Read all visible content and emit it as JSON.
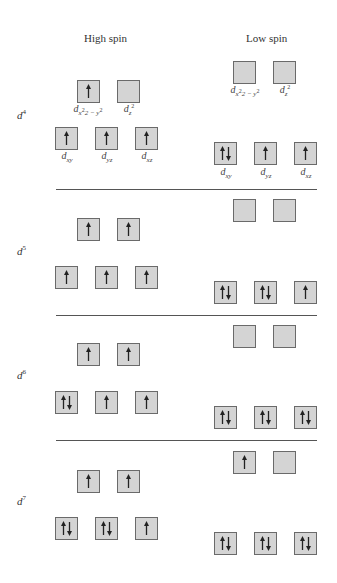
{
  "headers": {
    "high_spin": "High spin",
    "low_spin": "Low spin"
  },
  "orbital_labels": {
    "dx2y2": {
      "base": "d",
      "sub": "x",
      "rest": "2 − y",
      "sup": "2"
    },
    "dz2": {
      "base": "d",
      "sub": "z",
      "sup": "2"
    },
    "dxy": {
      "base": "d",
      "sub": "xy"
    },
    "dyz": {
      "base": "d",
      "sub": "yz"
    },
    "dxz": {
      "base": "d",
      "sub": "xz"
    }
  },
  "configs": [
    {
      "label_base": "d",
      "label_sup": "4",
      "high": {
        "eg": [
          "up",
          "empty"
        ],
        "t2g": [
          "up",
          "up",
          "up"
        ]
      },
      "low": {
        "eg": [
          "empty",
          "empty"
        ],
        "t2g": [
          "pair",
          "up",
          "up"
        ]
      }
    },
    {
      "label_base": "d",
      "label_sup": "5",
      "high": {
        "eg": [
          "up",
          "up"
        ],
        "t2g": [
          "up",
          "up",
          "up"
        ]
      },
      "low": {
        "eg": [
          "empty",
          "empty"
        ],
        "t2g": [
          "pair",
          "pair",
          "up"
        ]
      }
    },
    {
      "label_base": "d",
      "label_sup": "6",
      "high": {
        "eg": [
          "up",
          "up"
        ],
        "t2g": [
          "pair",
          "up",
          "up"
        ]
      },
      "low": {
        "eg": [
          "empty",
          "empty"
        ],
        "t2g": [
          "pair",
          "pair",
          "pair"
        ]
      }
    },
    {
      "label_base": "d",
      "label_sup": "7",
      "high": {
        "eg": [
          "up",
          "up"
        ],
        "t2g": [
          "pair",
          "pair",
          "up"
        ]
      },
      "low": {
        "eg": [
          "up",
          "empty"
        ],
        "t2g": [
          "pair",
          "pair",
          "pair"
        ]
      }
    }
  ],
  "colors": {
    "box_fill": "#d4d4d4",
    "box_border": "#6a6a6a",
    "arrow": "#222222",
    "divider": "#555555"
  }
}
